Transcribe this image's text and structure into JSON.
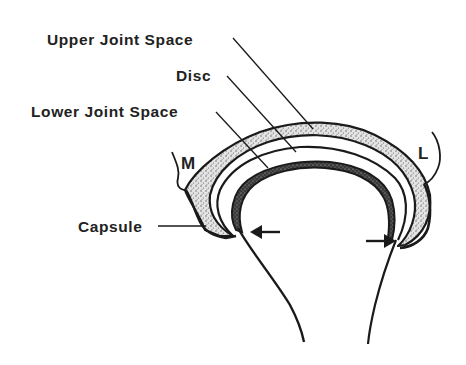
{
  "diagram": {
    "labels": {
      "upper_joint_space": "Upper Joint Space",
      "disc": "Disc",
      "lower_joint_space": "Lower Joint Space",
      "capsule": "Capsule",
      "medial": "M",
      "lateral": "L"
    },
    "arrows": [
      {
        "id": "left-arrow",
        "direction": "left"
      },
      {
        "id": "right-arrow",
        "direction": "right"
      }
    ],
    "colors": {
      "ink": "#1a1a1a",
      "stipple_fill": "#d9d9d9",
      "background": "#ffffff"
    }
  }
}
